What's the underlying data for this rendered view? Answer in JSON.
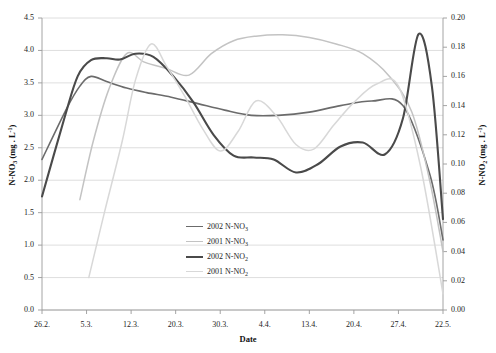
{
  "chart_data": {
    "type": "line",
    "title": "",
    "xlabel": "Date",
    "ylabel": "N-NO3 (mg . L-1)",
    "ylabel_right": "N-NO2 (mg . L-1)",
    "grid": true,
    "legend_position": "inside-bottom-center",
    "categories": [
      "26.2.",
      "5.3.",
      "12.3.",
      "20.3.",
      "30.3.",
      "4.4.",
      "13.4.",
      "20.4.",
      "27.4.",
      "22.5."
    ],
    "x_tick_positions": [
      0,
      1,
      2,
      3,
      4,
      5,
      6,
      7,
      8,
      9
    ],
    "ylim": [
      0.0,
      4.5
    ],
    "yticks": [
      "0.0",
      "0.5",
      "1.0",
      "1.5",
      "2.0",
      "2.5",
      "3.0",
      "3.5",
      "4.0",
      "4.5"
    ],
    "ylim_right": [
      0.0,
      0.2
    ],
    "yticks_right": [
      "0.00",
      "0.02",
      "0.04",
      "0.06",
      "0.08",
      "0.10",
      "0.12",
      "0.14",
      "0.16",
      "0.18",
      "0.20"
    ],
    "series": [
      {
        "name": "2002 N-NO3",
        "name_display": "2002 N-NO",
        "name_sub": "3",
        "axis": "left",
        "color": "#6b6b6b",
        "width": 1.6,
        "x": [
          0.0,
          0.55,
          0.85,
          1.1,
          1.45,
          1.9,
          2.35,
          2.9,
          3.5,
          4.1,
          4.7,
          5.3,
          6.0,
          6.7,
          7.4,
          8.1,
          8.7,
          9.0
        ],
        "values": [
          2.32,
          3.1,
          3.45,
          3.6,
          3.52,
          3.42,
          3.35,
          3.28,
          3.18,
          3.08,
          3.0,
          3.0,
          3.05,
          3.15,
          3.22,
          3.15,
          2.1,
          1.08
        ]
      },
      {
        "name": "2001 N-NO3",
        "name_display": "2001 N-NO",
        "name_sub": "3",
        "axis": "left",
        "color": "#c3c3c3",
        "width": 1.5,
        "x": [
          0.85,
          1.15,
          1.5,
          1.9,
          2.3,
          2.8,
          3.3,
          3.8,
          4.3,
          4.8,
          5.4,
          6.0,
          6.6,
          7.2,
          7.8,
          8.3,
          8.7,
          9.0
        ],
        "values": [
          1.7,
          2.6,
          3.4,
          3.95,
          3.82,
          3.72,
          3.62,
          3.95,
          4.15,
          4.22,
          4.24,
          4.2,
          4.1,
          3.95,
          3.6,
          3.05,
          2.0,
          0.9
        ]
      },
      {
        "name": "2002 N-NO2",
        "name_display": "2002 N-NO",
        "name_sub": "2",
        "axis": "right",
        "color": "#4a4a4a",
        "width": 2.1,
        "x": [
          0.0,
          0.5,
          0.8,
          1.1,
          1.45,
          1.75,
          2.1,
          2.5,
          2.95,
          3.4,
          3.85,
          4.3,
          4.75,
          5.2,
          5.7,
          6.2,
          6.7,
          7.2,
          7.7,
          8.1,
          8.45,
          8.75,
          9.0
        ],
        "values": [
          1.75,
          2.95,
          3.6,
          3.85,
          3.88,
          3.86,
          3.95,
          3.9,
          3.6,
          3.2,
          2.7,
          2.38,
          2.35,
          2.32,
          2.12,
          2.25,
          2.52,
          2.58,
          2.4,
          2.95,
          4.25,
          3.45,
          1.4
        ]
      },
      {
        "name": "2001 N-NO2",
        "name_display": "2001 N-NO",
        "name_sub": "2",
        "axis": "right",
        "color": "#d8d8d8",
        "width": 1.5,
        "x": [
          1.05,
          1.4,
          1.8,
          2.1,
          2.45,
          2.8,
          3.2,
          3.6,
          4.0,
          4.4,
          4.8,
          5.25,
          5.7,
          6.1,
          6.55,
          7.0,
          7.5,
          8.0,
          8.5,
          9.0
        ],
        "values": [
          0.5,
          1.5,
          2.6,
          3.55,
          4.1,
          3.75,
          3.3,
          2.8,
          2.45,
          2.75,
          3.22,
          3.0,
          2.55,
          2.48,
          2.85,
          3.2,
          3.48,
          3.45,
          2.2,
          0.25
        ]
      }
    ],
    "plot_area": {
      "left": 42,
      "top": 18,
      "right": 443,
      "bottom": 310
    }
  },
  "legend": {
    "entries": [
      {
        "label_main": "2002 N-NO",
        "label_sub": "3",
        "color": "#6b6b6b",
        "width": "1.6px"
      },
      {
        "label_main": "2001 N-NO",
        "label_sub": "3",
        "color": "#c3c3c3",
        "width": "1.5px"
      },
      {
        "label_main": "2002 N-NO",
        "label_sub": "2",
        "color": "#4a4a4a",
        "width": "2.1px"
      },
      {
        "label_main": "2001 N-NO",
        "label_sub": "2",
        "color": "#d8d8d8",
        "width": "1.3px"
      }
    ]
  },
  "axes": {
    "x_title": "Date",
    "y_left_main": "N-NO",
    "y_left_sub": "3",
    "y_left_unit": " (mg . L",
    "y_left_sup": "-1",
    "y_left_close": ")",
    "y_right_main": "N-NO",
    "y_right_sub": "2",
    "y_right_unit": " (mg . L",
    "y_right_sup": "-1",
    "y_right_close": ")"
  },
  "colors": {
    "grid": "#d5d5d5",
    "axis": "#9a9a9a",
    "text": "#1c1c1c",
    "background": "#ffffff"
  }
}
